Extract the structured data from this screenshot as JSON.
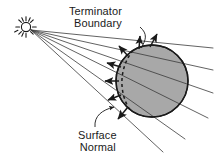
{
  "figure": {
    "background_color": "#ffffff",
    "width": 214,
    "height": 160
  },
  "labels": {
    "terminator": {
      "line1": "Terminator",
      "line2": "Boundary"
    },
    "surface_normal": {
      "line1": "Surface",
      "line2": "Normal"
    }
  },
  "colors": {
    "stroke": "#1a1a1a",
    "sphere_fill": "#a8a8a8",
    "crescent_fill": "#ffffff",
    "text": "#1a1a1a",
    "ray_stroke": "#3a3a3a"
  },
  "diagram": {
    "sun": {
      "center_x": 26,
      "center_y": 27,
      "core_radius": 5,
      "ray_count": 12,
      "ray_inner": 6.5,
      "ray_outer": 10
    },
    "sphere": {
      "center_x": 152,
      "center_y": 81,
      "radius": 36
    },
    "terminator": {
      "style": "dashed",
      "dash_pattern": "3 3"
    },
    "light_rays": {
      "count": 6,
      "origin_x": 31,
      "origin_y": 30
    },
    "surface_normals": {
      "count": 7
    }
  }
}
